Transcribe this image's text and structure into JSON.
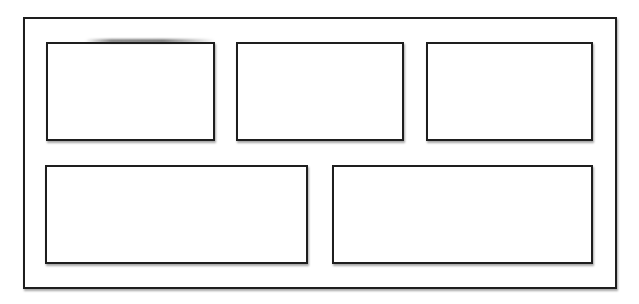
{
  "diagram": {
    "type": "wireframe-layout",
    "stroke_color": "#1e1e1e",
    "background_color": "#ffffff",
    "outer_frame": {
      "label": ""
    },
    "rows": [
      {
        "boxes": [
          {
            "label": ""
          },
          {
            "label": ""
          },
          {
            "label": ""
          }
        ]
      },
      {
        "boxes": [
          {
            "label": ""
          },
          {
            "label": ""
          }
        ]
      }
    ]
  }
}
